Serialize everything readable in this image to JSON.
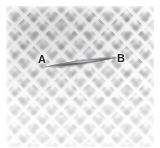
{
  "figure": {
    "caption": "",
    "image_type": "micrograph",
    "width_px": 160,
    "height_px": 148
  },
  "surface": {
    "name": "specimen-surface",
    "pattern": "diamond-lattice",
    "cell_pitch_px": 13.2,
    "base_color": "#fbfbfb",
    "cell_shadow_color": "#6c6c70",
    "ridge_highlight_color": "#ffffff"
  },
  "defect": {
    "name": "crack",
    "shape": "spindle",
    "start_point": "A",
    "end_point": "B",
    "start_xy": [
      47,
      66
    ],
    "end_xy": [
      119,
      58
    ],
    "max_thickness_px": 7,
    "color": "#6e6e72"
  },
  "annotations": [
    {
      "id": "label-a",
      "text": "A",
      "x": 38,
      "y": 54,
      "color": "#232323"
    },
    {
      "id": "label-b",
      "text": "B",
      "x": 117,
      "y": 53,
      "color": "#232323"
    }
  ],
  "colors": {
    "background": "#ffffff",
    "texture_dark": "#6c6c70",
    "texture_light": "#ffffff",
    "label_text": "#232323"
  }
}
